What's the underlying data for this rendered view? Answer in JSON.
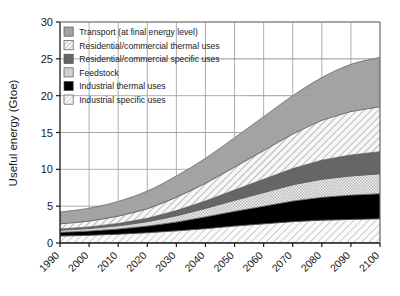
{
  "chart_data": {
    "type": "area",
    "title": "",
    "subtitle": "",
    "xlabel": "",
    "ylabel": "Useful energy (Gtoe)",
    "xlim": [
      1990,
      2100
    ],
    "ylim": [
      0,
      30
    ],
    "yticks": [
      0,
      5,
      10,
      15,
      20,
      25,
      30
    ],
    "ytick_labels": [
      "0",
      "5",
      "10",
      "15",
      "20",
      "25",
      "30"
    ],
    "x": [
      1990,
      2000,
      2010,
      2020,
      2030,
      2040,
      2050,
      2060,
      2070,
      2080,
      2090,
      2100
    ],
    "xtick_labels": [
      "1990",
      "2000",
      "2010",
      "2020",
      "2030",
      "2040",
      "2050",
      "2060",
      "2070",
      "2080",
      "2090",
      "2100"
    ],
    "grid": true,
    "grid_axes": "both",
    "stacked": true,
    "legend_position": "upper-left-inside",
    "series": [
      {
        "name": "Industrial specific uses",
        "order": 1,
        "fill": "hatch-diagonal-light",
        "color": "#f2f2f2",
        "values": [
          0.95,
          1.05,
          1.2,
          1.4,
          1.65,
          1.95,
          2.3,
          2.6,
          2.9,
          3.1,
          3.2,
          3.3
        ]
      },
      {
        "name": "Industrial thermal uses",
        "order": 2,
        "fill": "solid",
        "color": "#000000",
        "values": [
          0.5,
          0.58,
          0.7,
          0.9,
          1.2,
          1.6,
          2.0,
          2.4,
          2.8,
          3.1,
          3.3,
          3.4
        ]
      },
      {
        "name": "Feedstock",
        "order": 3,
        "fill": "checker-fine",
        "color": "#e2e2e2",
        "values": [
          0.3,
          0.35,
          0.45,
          0.6,
          0.85,
          1.15,
          1.5,
          1.85,
          2.2,
          2.45,
          2.6,
          2.7
        ]
      },
      {
        "name": "Residential/commercial specific uses",
        "order": 4,
        "fill": "solid",
        "color": "#666666",
        "values": [
          0.15,
          0.2,
          0.3,
          0.45,
          0.7,
          1.0,
          1.4,
          1.8,
          2.2,
          2.6,
          2.85,
          3.0
        ]
      },
      {
        "name": "Residential/commercial thermal uses",
        "order": 5,
        "fill": "hatch-diagonal",
        "color": "#ededed",
        "values": [
          0.7,
          0.8,
          1.0,
          1.3,
          1.8,
          2.4,
          3.1,
          3.9,
          4.7,
          5.4,
          5.9,
          6.1
        ]
      },
      {
        "name": "Transport (at final energy level)",
        "order": 6,
        "fill": "solid",
        "color": "#a3a3a3",
        "values": [
          1.6,
          1.75,
          2.0,
          2.4,
          2.9,
          3.4,
          4.0,
          4.6,
          5.2,
          5.8,
          6.4,
          6.7
        ]
      }
    ],
    "cumulative_totals": {
      "1990": 4.2,
      "2000": 4.73,
      "2010": 5.65,
      "2020": 7.05,
      "2030": 9.1,
      "2040": 11.5,
      "2050": 14.3,
      "2060": 17.15,
      "2070": 20.0,
      "2080": 22.45,
      "2090": 24.25,
      "2100": 25.2
    }
  },
  "legend": {
    "items": [
      {
        "label": "Transport (at final energy level)",
        "swatch": "solid-gray-medium"
      },
      {
        "label": "Residential/commercial thermal uses",
        "swatch": "hatch-diagonal"
      },
      {
        "label": "Residential/commercial specific uses",
        "swatch": "solid-gray-dark"
      },
      {
        "label": "Feedstock",
        "swatch": "checker-fine"
      },
      {
        "label": "Industrial thermal uses",
        "swatch": "solid-black"
      },
      {
        "label": "Industrial specific uses",
        "swatch": "hatch-diagonal-light"
      }
    ]
  },
  "colors": {
    "transport": "#a3a3a3",
    "res_thermal": "#ededed",
    "res_specific": "#666666",
    "feedstock": "#e2e2e2",
    "ind_thermal": "#000000",
    "ind_specific": "#f2f2f2",
    "axis": "#1a1a1a",
    "grid": "#9a9a9a",
    "background": "#ffffff"
  }
}
